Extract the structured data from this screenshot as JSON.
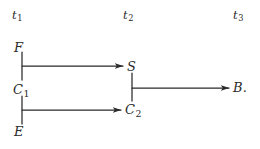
{
  "figure": {
    "background_color": "#ffffff",
    "ink_color": "#2a2a2a",
    "type": "temporal-causal-diagram"
  },
  "time_axis": {
    "labels": [
      {
        "id": "t1",
        "text": "t",
        "sub": "1"
      },
      {
        "id": "t2",
        "text": "t",
        "sub": "2"
      },
      {
        "id": "t3",
        "text": "t",
        "sub": "3"
      }
    ]
  },
  "nodes": [
    {
      "id": "F",
      "text": "F",
      "sub": "",
      "column": "t1"
    },
    {
      "id": "C1",
      "text": "C",
      "sub": "1",
      "column": "t1"
    },
    {
      "id": "E",
      "text": "E",
      "sub": "",
      "column": "t1"
    },
    {
      "id": "S",
      "text": "S",
      "sub": "",
      "column": "t2"
    },
    {
      "id": "C2",
      "text": "C",
      "sub": "2",
      "column": "t2"
    },
    {
      "id": "B",
      "text": "B.",
      "sub": "",
      "column": "t3"
    }
  ],
  "edges": [
    {
      "id": "f-c1",
      "from": "F",
      "to": "C1",
      "style": "vertical-segment"
    },
    {
      "id": "c1-e",
      "from": "C1",
      "to": "E",
      "style": "vertical-segment"
    },
    {
      "id": "fc1-s",
      "from": "F/C1 junction",
      "to": "S",
      "style": "horizontal-arrow"
    },
    {
      "id": "c1e-c2",
      "from": "C1/E junction",
      "to": "C2",
      "style": "horizontal-arrow"
    },
    {
      "id": "s-c2",
      "from": "S",
      "to": "C2",
      "style": "vertical-segment"
    },
    {
      "id": "sc2-b",
      "from": "S/C2 junction",
      "to": "B",
      "style": "horizontal-arrow"
    }
  ]
}
